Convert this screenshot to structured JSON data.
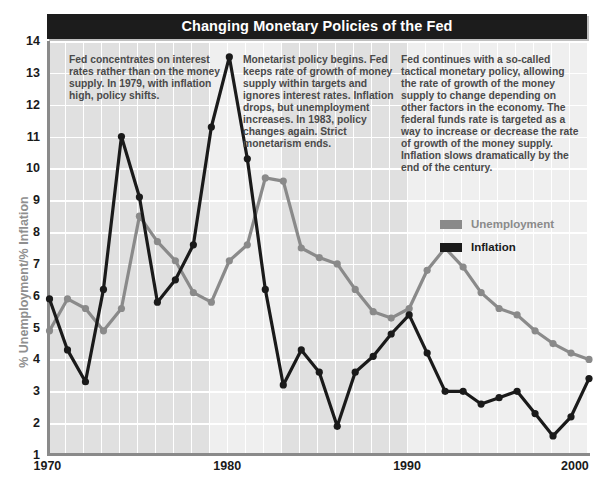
{
  "header": {
    "title": "Changing Monetary Policies of the Fed"
  },
  "annotations": [
    {
      "id": "policy-era-1",
      "text": "Fed concentrates on interest rates rather than on the money supply. In 1979, with inflation high, policy shifts."
    },
    {
      "id": "policy-era-2",
      "text": "Monetarist policy begins. Fed keeps rate of growth of money supply within targets and ignores interest rates. Inflation drops, but unemployment increases. In 1983, policy changes again. Strict monetarism ends."
    },
    {
      "id": "policy-era-3",
      "text": "Fed continues with a so-called tactical monetary policy, allowing the rate of growth of the money supply to change depending on other factors in the economy. The federal funds rate is targeted as a way to increase or decrease the rate of growth of the money supply. Inflation slows dramatically by the end of the century."
    }
  ],
  "colors": {
    "unemployment": "#8a8a8a",
    "inflation": "#1a1a1a",
    "title_bar": "#1c1c1c",
    "plot_background": "#e2e2e2",
    "band_light": "#efefef",
    "grid": "#ffffff",
    "axis": "#8a8a8a",
    "annotation_text": "#4a4a4a",
    "axis_label": "#8f8f8f"
  },
  "chart_data": {
    "type": "line",
    "title": "Changing Monetary Policies of the Fed",
    "xlabel": "",
    "ylabel": "% Unemployment/% Inflation",
    "xlim": [
      1970,
      2000
    ],
    "ylim": [
      1,
      14
    ],
    "grid": true,
    "legend_position": "inside-right",
    "xticks": [
      1970,
      1980,
      1990,
      2000
    ],
    "yticks": [
      1,
      2,
      3,
      4,
      5,
      6,
      7,
      8,
      9,
      10,
      11,
      12,
      13,
      14
    ],
    "x": [
      1970,
      1971,
      1972,
      1973,
      1974,
      1975,
      1976,
      1977,
      1978,
      1979,
      1980,
      1981,
      1982,
      1983,
      1984,
      1985,
      1986,
      1987,
      1988,
      1989,
      1990,
      1991,
      1992,
      1993,
      1994,
      1995,
      1996,
      1997,
      1998,
      1999,
      2000
    ],
    "series": [
      {
        "name": "Unemployment",
        "color": "#8a8a8a",
        "values": [
          4.9,
          5.9,
          5.6,
          4.9,
          5.6,
          8.5,
          7.7,
          7.1,
          6.1,
          5.8,
          7.1,
          7.6,
          9.7,
          9.6,
          7.5,
          7.2,
          7.0,
          6.2,
          5.5,
          5.3,
          5.6,
          6.8,
          7.5,
          6.9,
          6.1,
          5.6,
          5.4,
          4.9,
          4.5,
          4.2,
          4.0
        ]
      },
      {
        "name": "Inflation",
        "color": "#1a1a1a",
        "values": [
          5.9,
          4.3,
          3.3,
          6.2,
          11.0,
          9.1,
          5.8,
          6.5,
          7.6,
          11.3,
          13.5,
          10.3,
          6.2,
          3.2,
          4.3,
          3.6,
          1.9,
          3.6,
          4.1,
          4.8,
          5.4,
          4.2,
          3.0,
          3.0,
          2.6,
          2.8,
          3.0,
          2.3,
          1.6,
          2.2,
          3.4
        ]
      }
    ]
  },
  "legend": {
    "items": [
      {
        "label": "Unemployment",
        "color": "#8a8a8a"
      },
      {
        "label": "Inflation",
        "color": "#1a1a1a"
      }
    ]
  },
  "axis_label_text": "% Unemployment/% Inflation"
}
